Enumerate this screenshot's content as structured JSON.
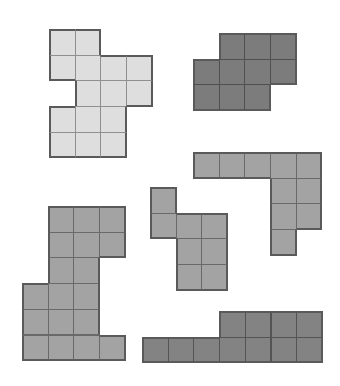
{
  "cell_size": 25.7,
  "shapes": [
    {
      "name": "shape-light-top-left",
      "x": 49,
      "y": 29,
      "color": "#dedede",
      "cells": [
        [
          0,
          0
        ],
        [
          0,
          1
        ],
        [
          1,
          0
        ],
        [
          1,
          1
        ],
        [
          1,
          2
        ],
        [
          1,
          3
        ],
        [
          2,
          1
        ],
        [
          2,
          2
        ],
        [
          2,
          3
        ],
        [
          3,
          0
        ],
        [
          3,
          1
        ],
        [
          3,
          2
        ],
        [
          4,
          0
        ],
        [
          4,
          1
        ],
        [
          4,
          2
        ]
      ]
    },
    {
      "name": "shape-dark-top-right",
      "x": 193,
      "y": 33,
      "color": "#7c7c7c",
      "cells": [
        [
          0,
          1
        ],
        [
          0,
          2
        ],
        [
          0,
          3
        ],
        [
          1,
          0
        ],
        [
          1,
          1
        ],
        [
          1,
          2
        ],
        [
          1,
          3
        ],
        [
          2,
          0
        ],
        [
          2,
          1
        ],
        [
          2,
          2
        ]
      ]
    },
    {
      "name": "shape-medium-right-l",
      "x": 193,
      "y": 152,
      "color": "#a3a3a3",
      "cells": [
        [
          0,
          0
        ],
        [
          0,
          1
        ],
        [
          0,
          2
        ],
        [
          0,
          3
        ],
        [
          0,
          4
        ],
        [
          1,
          3
        ],
        [
          1,
          4
        ],
        [
          2,
          3
        ],
        [
          2,
          4
        ],
        [
          3,
          3
        ]
      ]
    },
    {
      "name": "shape-medium-center",
      "x": 150,
      "y": 187,
      "color": "#a3a3a3",
      "cells": [
        [
          0,
          0
        ],
        [
          1,
          0
        ],
        [
          1,
          1
        ],
        [
          1,
          2
        ],
        [
          2,
          1
        ],
        [
          2,
          2
        ],
        [
          3,
          1
        ],
        [
          3,
          2
        ]
      ]
    },
    {
      "name": "shape-medium-bottom-left",
      "x": 22,
      "y": 206,
      "color": "#a3a3a3",
      "cells": [
        [
          0,
          1
        ],
        [
          0,
          2
        ],
        [
          0,
          3
        ],
        [
          1,
          1
        ],
        [
          1,
          2
        ],
        [
          1,
          3
        ],
        [
          2,
          1
        ],
        [
          2,
          2
        ],
        [
          3,
          0
        ],
        [
          3,
          1
        ],
        [
          3,
          2
        ],
        [
          4,
          0
        ],
        [
          4,
          1
        ],
        [
          4,
          2
        ],
        [
          5,
          0
        ],
        [
          5,
          1
        ],
        [
          5,
          2
        ],
        [
          5,
          3
        ]
      ]
    },
    {
      "name": "shape-dark-bottom",
      "x": 142,
      "y": 311,
      "color": "#838383",
      "cells": [
        [
          0,
          3
        ],
        [
          0,
          4
        ],
        [
          0,
          5
        ],
        [
          0,
          6
        ],
        [
          1,
          0
        ],
        [
          1,
          1
        ],
        [
          1,
          2
        ],
        [
          1,
          3
        ],
        [
          1,
          4
        ],
        [
          1,
          5
        ],
        [
          1,
          6
        ]
      ]
    }
  ]
}
